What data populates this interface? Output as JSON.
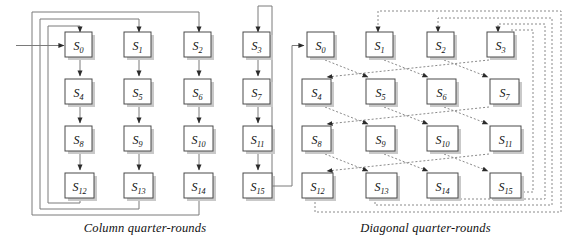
{
  "figure": {
    "type": "diagram",
    "background": "#ffffff",
    "line_color": "#6e6e6e",
    "box_border_color": "#4a4a4a",
    "box_fill": "#ffffff",
    "shadow_color": "#b9b9b9",
    "text_color": "#111111"
  },
  "panels": [
    {
      "id": "column",
      "caption": "Column quarter-rounds",
      "line_style": "solid",
      "grid": {
        "rows": 4,
        "cols": 4,
        "cells": [
          {
            "id": "s0",
            "label": "S",
            "sub": "0"
          },
          {
            "id": "s1",
            "label": "S",
            "sub": "1"
          },
          {
            "id": "s2",
            "label": "S",
            "sub": "2"
          },
          {
            "id": "s3",
            "label": "S",
            "sub": "3"
          },
          {
            "id": "s4",
            "label": "S",
            "sub": "4"
          },
          {
            "id": "s5",
            "label": "S",
            "sub": "5"
          },
          {
            "id": "s6",
            "label": "S",
            "sub": "6"
          },
          {
            "id": "s7",
            "label": "S",
            "sub": "7"
          },
          {
            "id": "s8",
            "label": "S",
            "sub": "8"
          },
          {
            "id": "s9",
            "label": "S",
            "sub": "9"
          },
          {
            "id": "s10",
            "label": "S",
            "sub": "10"
          },
          {
            "id": "s11",
            "label": "S",
            "sub": "11"
          },
          {
            "id": "s12",
            "label": "S",
            "sub": "12"
          },
          {
            "id": "s13",
            "label": "S",
            "sub": "13"
          },
          {
            "id": "s14",
            "label": "S",
            "sub": "14"
          },
          {
            "id": "s15",
            "label": "S",
            "sub": "15"
          }
        ]
      },
      "edges": [
        {
          "from": "input",
          "to": "s0",
          "kind": "entry-arrow"
        },
        {
          "from": "s0",
          "to": "s4",
          "kind": "vertical"
        },
        {
          "from": "s4",
          "to": "s8",
          "kind": "vertical"
        },
        {
          "from": "s8",
          "to": "s12",
          "kind": "vertical"
        },
        {
          "from": "s1",
          "to": "s5",
          "kind": "vertical"
        },
        {
          "from": "s5",
          "to": "s9",
          "kind": "vertical"
        },
        {
          "from": "s9",
          "to": "s13",
          "kind": "vertical"
        },
        {
          "from": "s2",
          "to": "s6",
          "kind": "vertical"
        },
        {
          "from": "s6",
          "to": "s10",
          "kind": "vertical"
        },
        {
          "from": "s10",
          "to": "s14",
          "kind": "vertical"
        },
        {
          "from": "s3",
          "to": "s7",
          "kind": "vertical"
        },
        {
          "from": "s7",
          "to": "s11",
          "kind": "vertical"
        },
        {
          "from": "s11",
          "to": "s15",
          "kind": "vertical"
        },
        {
          "from": "s12",
          "to": "s0",
          "kind": "feedback-loop"
        },
        {
          "from": "s13",
          "to": "s1",
          "kind": "feedback-loop"
        },
        {
          "from": "s14",
          "to": "s2",
          "kind": "feedback-loop"
        },
        {
          "from": "s15",
          "to": "s3",
          "kind": "feedback-loop"
        }
      ]
    },
    {
      "id": "diagonal",
      "caption": "Diagonal quarter-rounds",
      "line_style": "dashed",
      "grid": {
        "rows": 4,
        "cols": 4,
        "cells": [
          {
            "id": "d0",
            "label": "S",
            "sub": "0"
          },
          {
            "id": "d1",
            "label": "S",
            "sub": "1"
          },
          {
            "id": "d2",
            "label": "S",
            "sub": "2"
          },
          {
            "id": "d3",
            "label": "S",
            "sub": "3"
          },
          {
            "id": "d4",
            "label": "S",
            "sub": "4"
          },
          {
            "id": "d5",
            "label": "S",
            "sub": "5"
          },
          {
            "id": "d6",
            "label": "S",
            "sub": "6"
          },
          {
            "id": "d7",
            "label": "S",
            "sub": "7"
          },
          {
            "id": "d8",
            "label": "S",
            "sub": "8"
          },
          {
            "id": "d9",
            "label": "S",
            "sub": "9"
          },
          {
            "id": "d10",
            "label": "S",
            "sub": "10"
          },
          {
            "id": "d11",
            "label": "S",
            "sub": "11"
          },
          {
            "id": "d12",
            "label": "S",
            "sub": "12"
          },
          {
            "id": "d13",
            "label": "S",
            "sub": "13"
          },
          {
            "id": "d14",
            "label": "S",
            "sub": "14"
          },
          {
            "id": "d15",
            "label": "S",
            "sub": "15"
          }
        ]
      },
      "edges": [
        {
          "from": "column-s15",
          "to": "d0",
          "kind": "entry-arrow"
        },
        {
          "from": "d0",
          "to": "d5",
          "kind": "diagonal"
        },
        {
          "from": "d1",
          "to": "d6",
          "kind": "diagonal"
        },
        {
          "from": "d2",
          "to": "d7",
          "kind": "diagonal"
        },
        {
          "from": "d3",
          "to": "d4",
          "kind": "diagonal-wrap"
        },
        {
          "from": "d4",
          "to": "d9",
          "kind": "diagonal"
        },
        {
          "from": "d5",
          "to": "d10",
          "kind": "diagonal"
        },
        {
          "from": "d6",
          "to": "d11",
          "kind": "diagonal"
        },
        {
          "from": "d7",
          "to": "d8",
          "kind": "diagonal-wrap"
        },
        {
          "from": "d8",
          "to": "d13",
          "kind": "diagonal"
        },
        {
          "from": "d9",
          "to": "d14",
          "kind": "diagonal"
        },
        {
          "from": "d10",
          "to": "d15",
          "kind": "diagonal"
        },
        {
          "from": "d11",
          "to": "d12",
          "kind": "diagonal-wrap"
        },
        {
          "from": "d12",
          "to": "d1",
          "kind": "feedback-loop"
        },
        {
          "from": "d13",
          "to": "d2",
          "kind": "feedback-loop"
        },
        {
          "from": "d14",
          "to": "d3",
          "kind": "feedback-loop"
        },
        {
          "from": "d15",
          "to": "d15",
          "kind": "feedback-loop"
        }
      ]
    }
  ]
}
